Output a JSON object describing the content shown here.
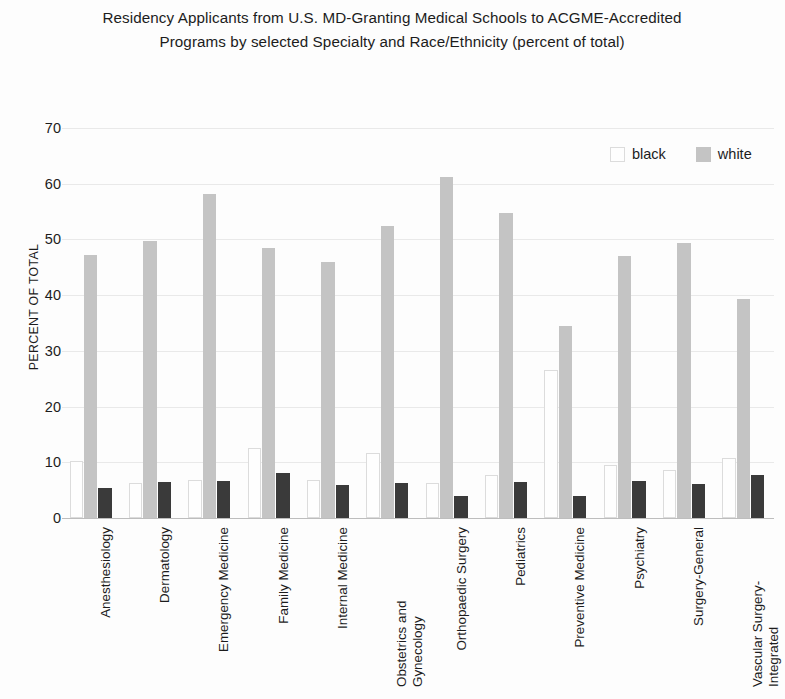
{
  "chart_data": {
    "type": "bar",
    "title": "Residency Applicants from U.S. MD-Granting Medical Schools to ACGME-Accredited Programs by selected Specialty and Race/Ethnicity (percent of total)",
    "xlabel": "",
    "ylabel": "PERCENT OF TOTAL",
    "ylim": [
      0,
      70
    ],
    "yticks": [
      0,
      10,
      20,
      30,
      40,
      50,
      60,
      70
    ],
    "grid": true,
    "legend_position": "top-right",
    "categories": [
      "Anesthesiology",
      "Dermatology",
      "Emergency Medicine",
      "Family Medicine",
      "Internal Medicine",
      "Obstetrics and Gynecology",
      "Orthopaedic Surgery",
      "Pediatrics",
      "Preventive Medicine",
      "Psychiatry",
      "Surgery-General",
      "Vascular Surgery-Integrated"
    ],
    "series": [
      {
        "name": "black",
        "swatch": "#fefefe",
        "values": [
          10.2,
          6.2,
          6.8,
          12.5,
          6.9,
          11.7,
          6.3,
          7.7,
          26.5,
          9.5,
          8.7,
          10.8
        ]
      },
      {
        "name": "white",
        "swatch": "#c4c4c4",
        "values": [
          47.2,
          49.8,
          58.1,
          48.5,
          46.0,
          52.5,
          61.2,
          54.7,
          34.5,
          47.1,
          49.4,
          39.4
        ]
      },
      {
        "name": "third",
        "swatch": "#3a3a3a",
        "values": [
          5.4,
          6.5,
          6.6,
          8.1,
          5.9,
          6.2,
          4.0,
          6.5,
          3.9,
          6.6,
          6.1,
          7.7
        ]
      }
    ]
  },
  "legend": {
    "entries": [
      {
        "label": "black",
        "color": "#fefefe"
      },
      {
        "label": "white",
        "color": "#c4c4c4"
      }
    ]
  },
  "axis": {
    "y_title": "PERCENT OF TOTAL"
  },
  "xlabels": [
    {
      "line1": "Anesthesiology",
      "line2": ""
    },
    {
      "line1": "Dermatology",
      "line2": ""
    },
    {
      "line1": "Emergency Medicine",
      "line2": ""
    },
    {
      "line1": "Family Medicine",
      "line2": ""
    },
    {
      "line1": "Internal Medicine",
      "line2": ""
    },
    {
      "line1": "Obstetrics and",
      "line2": "Gynecology"
    },
    {
      "line1": "Orthopaedic Surgery",
      "line2": ""
    },
    {
      "line1": "Pediatrics",
      "line2": ""
    },
    {
      "line1": "Preventive Medicine",
      "line2": ""
    },
    {
      "line1": "Psychiatry",
      "line2": ""
    },
    {
      "line1": "Surgery-General",
      "line2": ""
    },
    {
      "line1": "Vascular Surgery-",
      "line2": "Integrated"
    }
  ]
}
